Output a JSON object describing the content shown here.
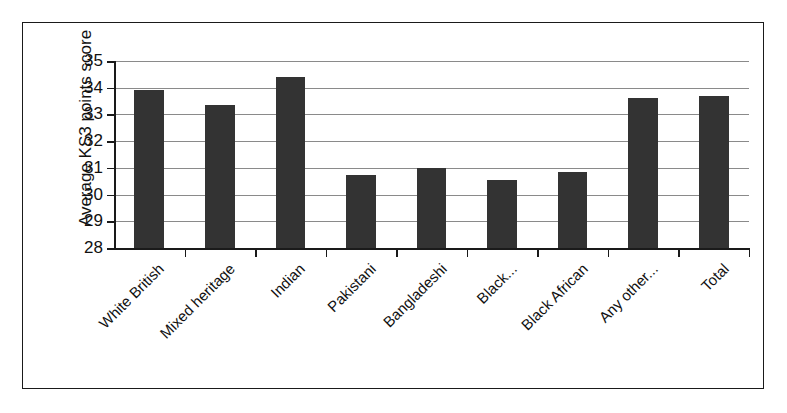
{
  "chart_data": {
    "type": "bar",
    "title": "",
    "xlabel": "",
    "ylabel": "Average KS3 points score",
    "categories": [
      "White British",
      "Mixed heritage",
      "Indian",
      "Pakistani",
      "Bangladeshi",
      "Black...",
      "Black African",
      "Any other...",
      "Total"
    ],
    "values": [
      33.9,
      33.35,
      34.4,
      30.75,
      31.0,
      30.55,
      30.85,
      33.6,
      33.7
    ],
    "ylim": [
      28,
      35
    ],
    "ytick_labels": [
      "35",
      "34",
      "33",
      "32",
      "31",
      "30",
      "29",
      "28"
    ],
    "ytick_values": [
      35,
      34,
      33,
      32,
      31,
      30,
      29,
      28
    ],
    "grid": true,
    "legend": false,
    "legend_position": "none",
    "series": [
      {
        "name": "Average KS3 points score",
        "values": [
          33.9,
          33.35,
          34.4,
          30.75,
          31.0,
          30.55,
          30.85,
          33.6,
          33.7
        ]
      }
    ],
    "colors": {
      "bar_fill": "#333333",
      "gridline": "#8a8a8a",
      "axis": "#1a1a1a",
      "frame_border": "#1a1a1a",
      "background": "#ffffff",
      "text": "#111111"
    }
  }
}
